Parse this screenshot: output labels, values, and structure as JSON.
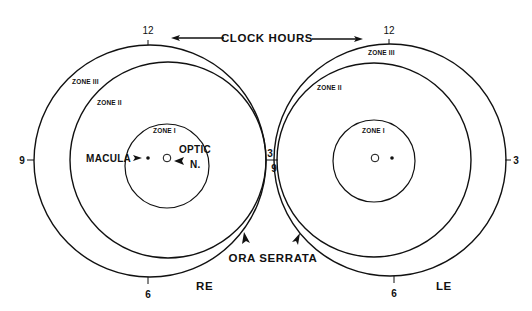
{
  "diagram": {
    "title_arrow_label": "CLOCK HOURS",
    "right_eye": {
      "eye_label": "RE",
      "clock": {
        "twelve": "12",
        "three": "3",
        "six": "6",
        "nine": "9"
      },
      "zones": {
        "zone1": "ZONE I",
        "zone2": "ZONE II",
        "zone3": "ZONE III"
      },
      "landmarks": {
        "macula": "MACULA",
        "optic_line1": "OPTIC",
        "optic_line2": "N."
      }
    },
    "left_eye": {
      "eye_label": "LE",
      "clock": {
        "twelve": "12",
        "three": "3",
        "six": "6",
        "nine": "9"
      },
      "zones": {
        "zone1": "ZONE I",
        "zone2": "ZONE II",
        "zone3": "ZONE III"
      }
    },
    "boundary_label": "ORA SERRATA",
    "colors": {
      "ink": "#111111",
      "background": "#ffffff"
    }
  }
}
